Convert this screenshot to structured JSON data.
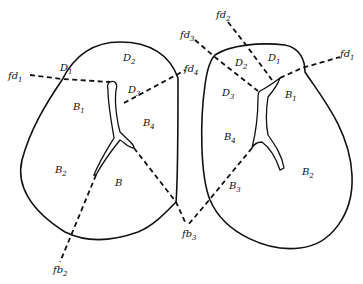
{
  "diagram": {
    "left_lung": {
      "regions": [
        {
          "id": "D1",
          "base": "D",
          "sub": "1",
          "x": 60,
          "y": 71
        },
        {
          "id": "D2",
          "base": "D",
          "sub": "2",
          "x": 123,
          "y": 61
        },
        {
          "id": "D3",
          "base": "D",
          "sub": "3",
          "x": 128,
          "y": 93
        },
        {
          "id": "B1",
          "base": "B",
          "sub": "1",
          "x": 73,
          "y": 110
        },
        {
          "id": "B4",
          "base": "B",
          "sub": "4",
          "x": 143,
          "y": 126
        },
        {
          "id": "B2",
          "base": "B",
          "sub": "2",
          "x": 55,
          "y": 173
        },
        {
          "id": "B",
          "base": "B",
          "sub": "",
          "x": 115,
          "y": 186
        }
      ],
      "fissure_labels": [
        {
          "id": "fd1",
          "base": "fd",
          "sub": "1",
          "x": 8,
          "y": 79
        },
        {
          "id": "fd4",
          "base": "fd",
          "sub": "4",
          "x": 184,
          "y": 72
        },
        {
          "id": "fb2",
          "base": "fb",
          "sub": "2",
          "x": 53,
          "y": 273
        }
      ]
    },
    "right_lung": {
      "regions": [
        {
          "id": "D2",
          "base": "D",
          "sub": "2",
          "x": 235,
          "y": 66
        },
        {
          "id": "D1",
          "base": "D",
          "sub": "1",
          "x": 268,
          "y": 61
        },
        {
          "id": "D3",
          "base": "D",
          "sub": "3",
          "x": 222,
          "y": 96
        },
        {
          "id": "B1",
          "base": "B",
          "sub": "1",
          "x": 285,
          "y": 98
        },
        {
          "id": "B4",
          "base": "B",
          "sub": "4",
          "x": 224,
          "y": 140
        },
        {
          "id": "B3",
          "base": "B",
          "sub": "3",
          "x": 229,
          "y": 189
        },
        {
          "id": "B2",
          "base": "B",
          "sub": "2",
          "x": 302,
          "y": 175
        }
      ],
      "fissure_labels": [
        {
          "id": "fd2",
          "base": "fd",
          "sub": "2",
          "x": 216,
          "y": 18
        },
        {
          "id": "fd3",
          "base": "fd",
          "sub": "3",
          "x": 180,
          "y": 38
        },
        {
          "id": "fd1",
          "base": "fd",
          "sub": "1",
          "x": 340,
          "y": 57
        }
      ]
    },
    "shared_labels": [
      {
        "id": "fb3",
        "base": "fb",
        "sub": "3",
        "x": 182,
        "y": 237
      }
    ],
    "colors": {
      "stroke": "#111111",
      "background": "#ffffff"
    }
  }
}
